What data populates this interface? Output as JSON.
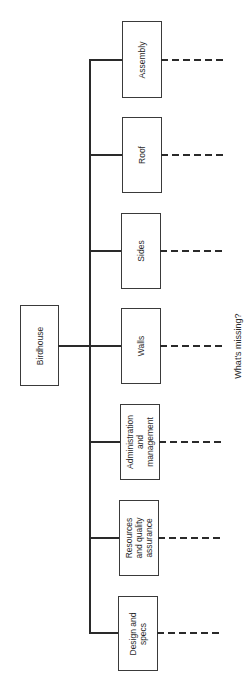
{
  "diagram": {
    "type": "work-breakdown-structure",
    "root": {
      "label": "Birdhouse"
    },
    "children": [
      {
        "label": "Assembly"
      },
      {
        "label": "Roof"
      },
      {
        "label": "Sides"
      },
      {
        "label": "Walls"
      },
      {
        "label": "Administration\nand\nmanagement"
      },
      {
        "label": "Resources\nand quality\nassurance"
      },
      {
        "label": "Design and\nspecs"
      }
    ],
    "annotation": "What's missing?"
  }
}
